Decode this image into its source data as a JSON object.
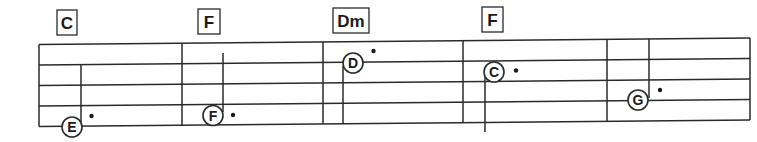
{
  "colors": {
    "ink": "#2a2a2a",
    "paper": "#ffffff"
  },
  "staff": {
    "type": "four-line tablature-style staff",
    "measures": 5
  },
  "chords": [
    {
      "label": "C"
    },
    {
      "label": "F"
    },
    {
      "label": "Dm"
    },
    {
      "label": "F"
    }
  ],
  "notes": [
    {
      "letter": "E",
      "measure": 1,
      "dotted": true
    },
    {
      "letter": "F",
      "measure": 2,
      "dotted": true
    },
    {
      "letter": "D",
      "measure": 3,
      "dotted": true
    },
    {
      "letter": "C",
      "measure": 4,
      "dotted": true
    },
    {
      "letter": "G",
      "measure": 5,
      "dotted": true
    }
  ]
}
